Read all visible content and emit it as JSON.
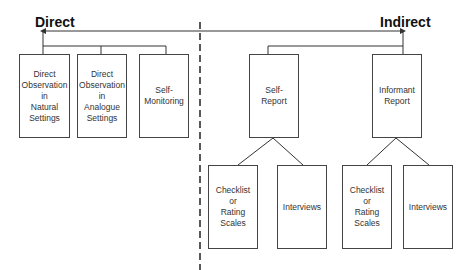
{
  "headings": {
    "direct": "Direct",
    "indirect": "Indirect"
  },
  "direct": {
    "boxes": [
      {
        "label": "Direct\nObservation\nin\nNatural\nSettings"
      },
      {
        "label": "Direct\nObservation\nin\nAnalogue\nSettings"
      },
      {
        "label": "Self-\nMonitoring"
      }
    ]
  },
  "indirect": {
    "boxes": [
      {
        "label": "Self-\nReport",
        "children": [
          "Checklist\nor\nRating\nScales",
          "Interviews"
        ]
      },
      {
        "label": "Informant\nReport",
        "children": [
          "Checklist\nor\nRating\nScales",
          "Interviews"
        ]
      }
    ]
  },
  "colors": {
    "line": "#333333",
    "box_border": "#444444"
  }
}
